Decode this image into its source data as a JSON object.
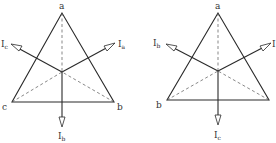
{
  "diagrams": [
    {
      "name": "left-phasor-diagram",
      "vertices": {
        "top": "a",
        "left": "c",
        "right": "b"
      },
      "currents": {
        "upper_right": {
          "main": "I",
          "sub": "a"
        },
        "upper_left": {
          "main": "I",
          "sub": "c"
        },
        "down": {
          "main": "I",
          "sub": "b"
        }
      }
    },
    {
      "name": "right-phasor-diagram",
      "vertices": {
        "top": "a",
        "left": "b",
        "right": ""
      },
      "currents": {
        "upper_right": {
          "main": "I",
          "sub": ""
        },
        "upper_left": {
          "main": "I",
          "sub": "b"
        },
        "down": {
          "main": "I",
          "sub": "c"
        }
      }
    }
  ]
}
